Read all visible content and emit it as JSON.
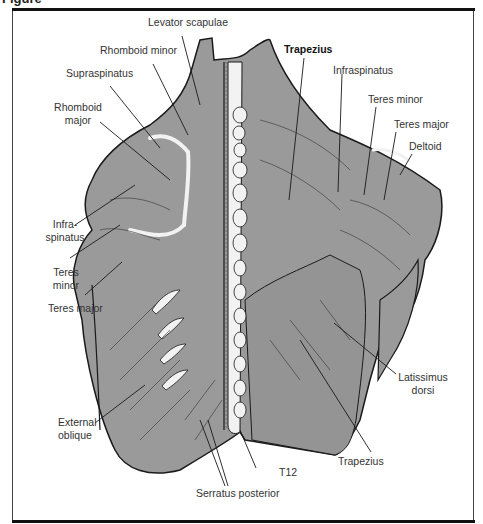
{
  "figure": {
    "title_fragment": "Figure",
    "colors": {
      "muscle_fill": "#9a9a9a",
      "outline": "#1a1a1a",
      "bone": "#f2f2f2",
      "frame": "#111111"
    },
    "labels": {
      "levator_scapulae": "Levator scapulae",
      "rhomboid_minor": "Rhomboid minor",
      "supraspinatus": "Supraspinatus",
      "rhomboid_major_1": "Rhomboid",
      "rhomboid_major_2": "major",
      "infraspinatus_left_1": "Infra-",
      "infraspinatus_left_2": "spinatus",
      "teres_minor_left_1": "Teres",
      "teres_minor_left_2": "minor",
      "teres_major_left": "Teres major",
      "external_oblique_1": "External",
      "external_oblique_2": "oblique",
      "serratus_posterior": "Serratus posterior",
      "t12": "T12",
      "trapezius_top": "Trapezius",
      "infraspinatus_right": "Infraspinatus",
      "teres_minor_right": "Teres minor",
      "teres_major_right": "Teres major",
      "deltoid": "Deltoid",
      "latissimus_dorsi_1": "Latissimus",
      "latissimus_dorsi_2": "dorsi",
      "trapezius_bottom": "Trapezius"
    }
  }
}
